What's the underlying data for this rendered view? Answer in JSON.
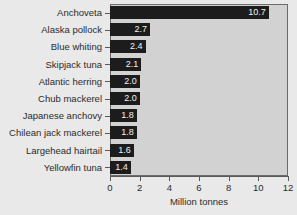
{
  "chart_data": {
    "type": "bar",
    "orientation": "horizontal",
    "title": "",
    "xlabel": "Million tonnes",
    "ylabel": "",
    "xlim": [
      0,
      12
    ],
    "xticks": [
      0,
      2,
      4,
      6,
      8,
      10,
      12
    ],
    "grid": false,
    "legend": null,
    "categories": [
      "Anchoveta",
      "Alaska pollock",
      "Blue whiting",
      "Skipjack tuna",
      "Atlantic herring",
      "Chub mackerel",
      "Japanese anchovy",
      "Chilean jack mackerel",
      "Largehead hairtail",
      "Yellowfin tuna"
    ],
    "values": [
      10.7,
      2.7,
      2.4,
      2.1,
      2.0,
      2.0,
      1.8,
      1.8,
      1.6,
      1.4
    ],
    "value_labels": [
      "10.7",
      "2.7",
      "2.4",
      "2.1",
      "2.0",
      "2.0",
      "1.8",
      "1.8",
      "1.6",
      "1.4"
    ],
    "colors": {
      "bar": "#1c1c1c",
      "bar_label_text": "#f2f2f2",
      "plot_background": "#d2d2d2",
      "figure_background": "#e9e9e9",
      "axis_line": "#5a5a5a",
      "text": "#2b2b2b"
    }
  }
}
